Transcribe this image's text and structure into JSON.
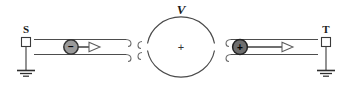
{
  "figure": {
    "kind": "physics-circuit-diagram",
    "background_color": "#ffffff",
    "width": 352,
    "height": 92
  },
  "labels": {
    "source_terminal": "S",
    "target_terminal": "T",
    "voltage": "V",
    "center_polarity": "+"
  },
  "particles": {
    "left": {
      "charge_sign": "−",
      "fill_color": "#9a9a9a",
      "stroke_color": "#333333",
      "direction": "right"
    },
    "right": {
      "charge_sign": "+",
      "fill_color": "#6e6e6e",
      "stroke_color": "#222222",
      "direction": "right"
    }
  },
  "colors": {
    "wire": "#4d4d4d",
    "ground": "#3a3a3a",
    "circle": "#4a4a4a",
    "arrow_outline": "#555555",
    "text": "#1a1a1a"
  }
}
